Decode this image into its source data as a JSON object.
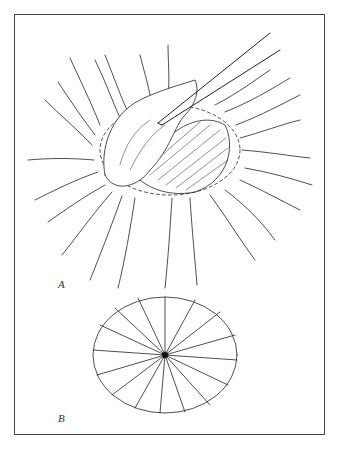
{
  "figure": {
    "panels": [
      {
        "id": "A",
        "label": "A",
        "description": "Tissue grasped by forceps, lifted from a circular wound with radiating purse-string sutures"
      },
      {
        "id": "B",
        "label": "B",
        "description": "Oval gathered closure with radial folds converging to a central point"
      }
    ],
    "colors": {
      "line": "#222222",
      "frame": "#444444",
      "background": "#ffffff"
    }
  }
}
